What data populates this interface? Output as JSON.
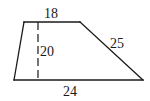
{
  "figure": {
    "type": "trapezoid",
    "labels": {
      "top_base": "18",
      "height": "20",
      "slant_side": "25",
      "bottom_base": "24"
    },
    "vertices": {
      "top_left": [
        24,
        22
      ],
      "top_right": [
        80,
        22
      ],
      "bottom_right": [
        143,
        80
      ],
      "bottom_left": [
        14,
        80
      ]
    },
    "height_line": {
      "x": 38,
      "y1": 22,
      "y2": 79,
      "style": "dashed"
    },
    "colors": {
      "stroke": "#1a1a1a",
      "background": "#ffffff"
    }
  }
}
